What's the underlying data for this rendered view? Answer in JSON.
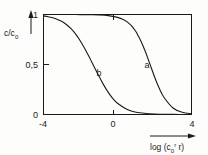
{
  "chart_data": {
    "type": "line",
    "title": "",
    "subtitle": "",
    "xlabel": "log (c0r r)",
    "xlabel_parts": {
      "prefix": "log (c",
      "sub": "0",
      "sup": "r",
      "suffix": " r)"
    },
    "ylabel": "c/c0",
    "ylabel_parts": {
      "prefix": "c/c",
      "sub": "0"
    },
    "xlim": [
      -4,
      4
    ],
    "ylim": [
      0,
      1
    ],
    "xticks": [
      -4,
      0,
      4
    ],
    "xtick_labels": [
      "-4",
      "0",
      "4"
    ],
    "yticks": [
      0,
      0.5,
      1
    ],
    "ytick_labels": [
      "0",
      "0,5",
      "1"
    ],
    "grid": false,
    "legend": "inline-curve-labels",
    "axis_color": "#1a1a1a",
    "curve_color": "#1a1a1a",
    "background_color": "#fdfdfc",
    "series": [
      {
        "name": "a",
        "label": "a",
        "label_x": 1.6,
        "label_y": 0.5,
        "midpoint_x": 1.1,
        "slope": 1.55,
        "description": "descending sigmoid, right curve",
        "x": [
          -4.0,
          -3.5,
          -3.0,
          -2.5,
          -2.0,
          -1.5,
          -1.0,
          -0.5,
          0.0,
          0.25,
          0.5,
          0.75,
          1.0,
          1.1,
          1.25,
          1.5,
          1.75,
          2.0,
          2.25,
          2.5,
          3.0,
          3.5,
          4.0
        ],
        "values": [
          1.0,
          1.0,
          1.0,
          1.0,
          0.999,
          0.998,
          0.996,
          0.989,
          0.971,
          0.955,
          0.929,
          0.889,
          0.827,
          0.793,
          0.741,
          0.632,
          0.506,
          0.378,
          0.265,
          0.175,
          0.065,
          0.022,
          0.008
        ]
      },
      {
        "name": "b",
        "label": "b",
        "label_x": -1.0,
        "label_y": 0.42,
        "midpoint_x": -1.4,
        "slope": 1.55,
        "description": "descending sigmoid, left curve",
        "x": [
          -4.0,
          -3.75,
          -3.5,
          -3.25,
          -3.0,
          -2.75,
          -2.5,
          -2.25,
          -2.0,
          -1.75,
          -1.5,
          -1.4,
          -1.25,
          -1.0,
          -0.75,
          -0.5,
          -0.25,
          0.0,
          0.5,
          1.0,
          2.0,
          3.0,
          4.0
        ],
        "values": [
          0.985,
          0.978,
          0.967,
          0.951,
          0.929,
          0.898,
          0.856,
          0.801,
          0.733,
          0.653,
          0.565,
          0.528,
          0.473,
          0.382,
          0.296,
          0.221,
          0.159,
          0.112,
          0.052,
          0.023,
          0.004,
          0.001,
          0.0
        ]
      }
    ]
  },
  "axes": {
    "y_arrow": "up-arrow",
    "x_arrow": "right-arrow"
  }
}
